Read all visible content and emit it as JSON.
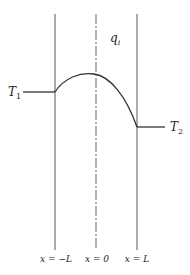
{
  "diagram": {
    "labels": {
      "heat_generation": "q",
      "heat_generation_sub": "i",
      "left_temp": "T",
      "left_temp_sub": "1",
      "right_temp": "T",
      "right_temp_sub": "2",
      "x_left": "x = −L",
      "x_center": "x = 0",
      "x_right": "x = L"
    },
    "colors": {
      "line": "#555555",
      "curve": "#333333"
    }
  }
}
